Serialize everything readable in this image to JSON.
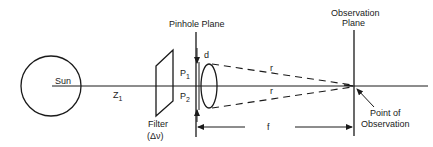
{
  "diagram": {
    "labels": {
      "sun": "Sun",
      "distance": "Z",
      "distance_sub": "1",
      "filter": "Filter",
      "filter_param": "(Δν)",
      "pinhole_plane": "Pinhole Plane",
      "pinhole_separation": "d",
      "pinhole1": "P",
      "pinhole1_sub": "1",
      "pinhole2": "P",
      "pinhole2_sub": "2",
      "ray_upper": "r",
      "ray_lower": "r",
      "observation_plane_line1": "Observation",
      "observation_plane_line2": "Plane",
      "point_of_observation_line1": "Point of",
      "point_of_observation_line2": "Observation",
      "focal_distance": "f"
    },
    "colors": {
      "ink": "#1a1a1a",
      "background": "#ffffff"
    }
  }
}
